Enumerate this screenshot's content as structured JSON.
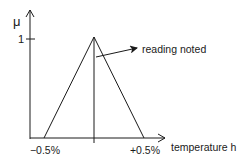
{
  "diagram": {
    "type": "triangular membership function",
    "y_axis": {
      "label": "μ",
      "tick_label": "1",
      "tick_value": 1
    },
    "x_axis": {
      "label": "temperature h",
      "tick_labels": [
        "−0.5%",
        "+0.5%"
      ],
      "tick_values": [
        -0.5,
        0.5
      ]
    },
    "triangle": {
      "left": -0.5,
      "peak": 0,
      "right": 0.5,
      "peak_membership": 1
    },
    "marker_line": {
      "x_value": 0
    },
    "annotation": {
      "text": "reading noted"
    }
  },
  "colors": {
    "stroke": "#1a1a1a",
    "background": "#ffffff"
  }
}
